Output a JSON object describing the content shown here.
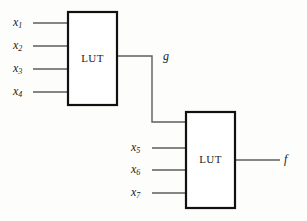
{
  "diagram": {
    "background_color": "#fdfdfc",
    "wire_color": "#5d5d5d",
    "box_border_color": "#111111",
    "box_fill_color": "#ffffff",
    "text_color": "#1a1a1a",
    "blocks": [
      {
        "id": "lut1",
        "label": "LUT",
        "x": 68,
        "y": 12,
        "width": 49,
        "height": 93
      },
      {
        "id": "lut2",
        "label": "LUT",
        "x": 186,
        "y": 112,
        "width": 49,
        "height": 96
      }
    ],
    "inputs_top": [
      {
        "base": "x",
        "sub": "1",
        "label": "x1",
        "label_x": 13,
        "label_y": 23,
        "wire_y": 23
      },
      {
        "base": "x",
        "sub": "2",
        "label": "x2",
        "label_x": 13,
        "label_y": 46,
        "wire_y": 46
      },
      {
        "base": "x",
        "sub": "3",
        "label": "x3",
        "label_x": 13,
        "label_y": 69,
        "wire_y": 69
      },
      {
        "base": "x",
        "sub": "4",
        "label": "x4",
        "label_x": 13,
        "label_y": 92,
        "wire_y": 92
      }
    ],
    "inputs_bottom": [
      {
        "base": "x",
        "sub": "5",
        "label": "x5",
        "label_x": 131,
        "label_y": 148,
        "wire_y": 148
      },
      {
        "base": "x",
        "sub": "6",
        "label": "x6",
        "label_x": 131,
        "label_y": 170,
        "wire_y": 170
      },
      {
        "base": "x",
        "sub": "7",
        "label": "x7",
        "label_x": 131,
        "label_y": 193,
        "wire_y": 193
      }
    ],
    "intermediate_signal": {
      "base": "g",
      "sub": "",
      "label": "g",
      "label_x": 163,
      "label_y": 57
    },
    "output_signal": {
      "base": "f",
      "sub": "",
      "label": "f",
      "label_x": 284,
      "label_y": 160
    },
    "wires": {
      "top_input_x_start": 33,
      "top_input_x_end": 68,
      "bottom_input_x_start": 152,
      "bottom_input_x_end": 186,
      "g_h1_x_start": 117,
      "g_h1_x_end": 152,
      "g_h1_y": 56,
      "g_vertical_x": 152,
      "g_vertical_y_start": 56,
      "g_vertical_y_end": 122,
      "g_h2_x_start": 152,
      "g_h2_x_end": 186,
      "g_h2_y": 122,
      "out_x_start": 235,
      "out_x_end": 280,
      "out_y": 160
    }
  }
}
